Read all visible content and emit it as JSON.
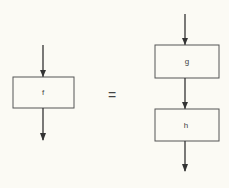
{
  "diagram": {
    "left": {
      "box_label": "f"
    },
    "operator": "=",
    "right": {
      "boxes": [
        {
          "label": "g"
        },
        {
          "label": "h"
        }
      ]
    },
    "colors": {
      "stroke": "#333333",
      "background": "#fbfaf4",
      "box_fill": "#fbfaf4"
    }
  }
}
